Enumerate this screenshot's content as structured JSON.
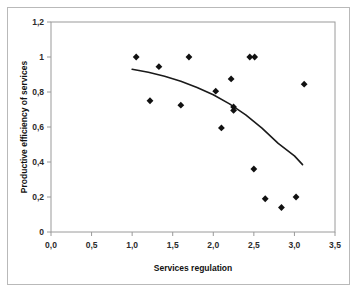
{
  "chart_data": {
    "type": "scatter",
    "title": "",
    "xlabel": "Services regulation",
    "ylabel": "Productive efficiency of services",
    "xlim": [
      0.0,
      3.5
    ],
    "ylim": [
      0.0,
      1.2
    ],
    "grid": false,
    "legend": false,
    "x_ticks": [
      "0,0",
      "0,5",
      "1,0",
      "1,5",
      "2,0",
      "2,5",
      "3,0",
      "3,5"
    ],
    "x_tick_values": [
      0.0,
      0.5,
      1.0,
      1.5,
      2.0,
      2.5,
      3.0,
      3.5
    ],
    "y_ticks": [
      "0",
      "0,2",
      "0,4",
      "0,6",
      "0,8",
      "1",
      "1,2"
    ],
    "y_tick_values": [
      0.0,
      0.2,
      0.4,
      0.6,
      0.8,
      1.0,
      1.2
    ],
    "marker": "diamond",
    "marker_color": "#111111",
    "points": [
      {
        "x": 1.05,
        "y": 1.0
      },
      {
        "x": 1.22,
        "y": 0.75
      },
      {
        "x": 1.33,
        "y": 0.945
      },
      {
        "x": 1.6,
        "y": 0.725
      },
      {
        "x": 1.7,
        "y": 1.0
      },
      {
        "x": 2.03,
        "y": 0.805
      },
      {
        "x": 2.1,
        "y": 0.595
      },
      {
        "x": 2.22,
        "y": 0.875
      },
      {
        "x": 2.25,
        "y": 0.715
      },
      {
        "x": 2.25,
        "y": 0.695
      },
      {
        "x": 2.45,
        "y": 1.0
      },
      {
        "x": 2.51,
        "y": 1.0
      },
      {
        "x": 2.5,
        "y": 0.36
      },
      {
        "x": 2.64,
        "y": 0.19
      },
      {
        "x": 2.84,
        "y": 0.14
      },
      {
        "x": 3.02,
        "y": 0.2
      },
      {
        "x": 3.12,
        "y": 0.845
      }
    ],
    "trendline": {
      "type": "polynomial",
      "color": "#1a1a1a",
      "x_start": 1.0,
      "x_end": 3.1,
      "points": [
        {
          "x": 1.0,
          "y": 0.93
        },
        {
          "x": 1.2,
          "y": 0.913
        },
        {
          "x": 1.4,
          "y": 0.89
        },
        {
          "x": 1.6,
          "y": 0.862
        },
        {
          "x": 1.8,
          "y": 0.826
        },
        {
          "x": 2.0,
          "y": 0.784
        },
        {
          "x": 2.2,
          "y": 0.732
        },
        {
          "x": 2.4,
          "y": 0.669
        },
        {
          "x": 2.6,
          "y": 0.594
        },
        {
          "x": 2.8,
          "y": 0.506
        },
        {
          "x": 3.0,
          "y": 0.435
        },
        {
          "x": 3.1,
          "y": 0.385
        }
      ]
    }
  }
}
